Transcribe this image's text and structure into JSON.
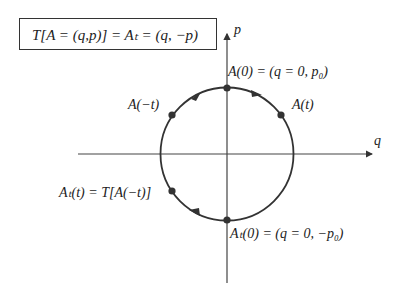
{
  "formula_box": {
    "text": "T[A = (q, p)] = A_T = (q, −p)",
    "display": "T[A = (q,p)] = Aₜ = (q, −p)"
  },
  "axes": {
    "horizontal_label": "q",
    "vertical_label": "p"
  },
  "points": [
    {
      "id": "A0",
      "label": "A(0) = (q = 0, p₀)"
    },
    {
      "id": "At",
      "label": "A(t)"
    },
    {
      "id": "Aminus_t",
      "label": "A(−t)"
    },
    {
      "id": "AT_t",
      "label": "Aₜ(t) = T[A(−t)]"
    },
    {
      "id": "AT0",
      "label": "Aₜ(0) = (q = 0, −p₀)"
    }
  ],
  "colors": {
    "stroke": "#333333",
    "text": "#222222",
    "background": "#ffffff"
  }
}
